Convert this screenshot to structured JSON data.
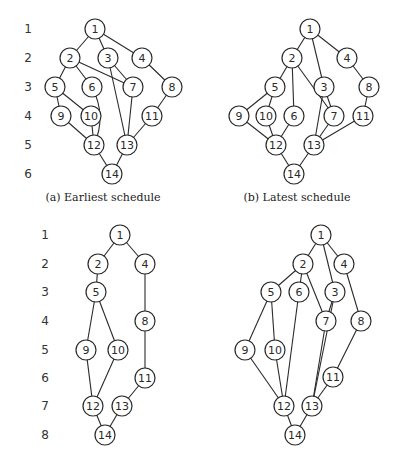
{
  "figure": {
    "node_radius": 10,
    "colors": {
      "stroke": "#2a2a2a",
      "fill": "#ffffff",
      "text": "#2a2a2a"
    }
  },
  "row_labels": [
    {
      "panel": "top",
      "x": 28,
      "rows": [
        {
          "label": "1",
          "y": 29
        },
        {
          "label": "2",
          "y": 58
        },
        {
          "label": "3",
          "y": 87
        },
        {
          "label": "4",
          "y": 116
        },
        {
          "label": "5",
          "y": 145
        },
        {
          "label": "6",
          "y": 174
        }
      ]
    },
    {
      "panel": "bottom",
      "x": 45,
      "rows": [
        {
          "label": "1",
          "y": 235
        },
        {
          "label": "2",
          "y": 264
        },
        {
          "label": "3",
          "y": 292
        },
        {
          "label": "4",
          "y": 321
        },
        {
          "label": "5",
          "y": 350
        },
        {
          "label": "6",
          "y": 378
        },
        {
          "label": "7",
          "y": 406
        },
        {
          "label": "8",
          "y": 435
        }
      ]
    }
  ],
  "graphs": [
    {
      "id": "a",
      "caption": "(a)  Earliest schedule",
      "caption_pos": [
        103,
        197
      ],
      "nodes": [
        {
          "id": "1",
          "x": 95,
          "y": 29
        },
        {
          "id": "2",
          "x": 70,
          "y": 58
        },
        {
          "id": "3",
          "x": 108,
          "y": 58
        },
        {
          "id": "4",
          "x": 142,
          "y": 58
        },
        {
          "id": "5",
          "x": 55,
          "y": 87
        },
        {
          "id": "6",
          "x": 92,
          "y": 87
        },
        {
          "id": "7",
          "x": 133,
          "y": 87
        },
        {
          "id": "8",
          "x": 172,
          "y": 87
        },
        {
          "id": "9",
          "x": 61,
          "y": 116
        },
        {
          "id": "10",
          "x": 91,
          "y": 116
        },
        {
          "id": "11",
          "x": 152,
          "y": 116
        },
        {
          "id": "12",
          "x": 94,
          "y": 145
        },
        {
          "id": "13",
          "x": 127,
          "y": 145
        },
        {
          "id": "14",
          "x": 112,
          "y": 174
        }
      ],
      "edges": [
        [
          "1",
          "2"
        ],
        [
          "1",
          "3"
        ],
        [
          "1",
          "4"
        ],
        [
          "2",
          "5"
        ],
        [
          "2",
          "6"
        ],
        [
          "2",
          "7"
        ],
        [
          "3",
          "7"
        ],
        [
          "3",
          "13"
        ],
        [
          "4",
          "8"
        ],
        [
          "5",
          "9"
        ],
        [
          "5",
          "10"
        ],
        [
          "6",
          "12",
          "curve"
        ],
        [
          "7",
          "13"
        ],
        [
          "8",
          "11"
        ],
        [
          "9",
          "12"
        ],
        [
          "10",
          "12"
        ],
        [
          "11",
          "13"
        ],
        [
          "12",
          "14"
        ],
        [
          "13",
          "14"
        ]
      ]
    },
    {
      "id": "b",
      "caption": "(b)  Latest schedule",
      "caption_pos": [
        297,
        197
      ],
      "nodes": [
        {
          "id": "1",
          "x": 310,
          "y": 29
        },
        {
          "id": "2",
          "x": 292,
          "y": 58
        },
        {
          "id": "4",
          "x": 347,
          "y": 58
        },
        {
          "id": "5",
          "x": 275,
          "y": 87
        },
        {
          "id": "3",
          "x": 324,
          "y": 87
        },
        {
          "id": "8",
          "x": 369,
          "y": 87
        },
        {
          "id": "9",
          "x": 239,
          "y": 116
        },
        {
          "id": "10",
          "x": 266,
          "y": 116
        },
        {
          "id": "6",
          "x": 294,
          "y": 116
        },
        {
          "id": "7",
          "x": 334,
          "y": 116
        },
        {
          "id": "11",
          "x": 363,
          "y": 116
        },
        {
          "id": "12",
          "x": 276,
          "y": 145
        },
        {
          "id": "13",
          "x": 314,
          "y": 145
        },
        {
          "id": "14",
          "x": 294,
          "y": 174
        }
      ],
      "edges": [
        [
          "1",
          "2"
        ],
        [
          "1",
          "3"
        ],
        [
          "1",
          "4"
        ],
        [
          "2",
          "5"
        ],
        [
          "2",
          "6"
        ],
        [
          "2",
          "7"
        ],
        [
          "3",
          "7"
        ],
        [
          "3",
          "13"
        ],
        [
          "4",
          "8"
        ],
        [
          "5",
          "9"
        ],
        [
          "5",
          "10"
        ],
        [
          "6",
          "12"
        ],
        [
          "7",
          "13"
        ],
        [
          "8",
          "11"
        ],
        [
          "9",
          "12"
        ],
        [
          "10",
          "12"
        ],
        [
          "11",
          "13"
        ],
        [
          "12",
          "14"
        ],
        [
          "13",
          "14"
        ]
      ]
    },
    {
      "id": "c",
      "caption": "",
      "caption_pos": null,
      "nodes": [
        {
          "id": "1",
          "x": 120,
          "y": 235
        },
        {
          "id": "2",
          "x": 98,
          "y": 264
        },
        {
          "id": "4",
          "x": 145,
          "y": 264
        },
        {
          "id": "5",
          "x": 96,
          "y": 292
        },
        {
          "id": "8",
          "x": 145,
          "y": 321
        },
        {
          "id": "9",
          "x": 86,
          "y": 350
        },
        {
          "id": "10",
          "x": 118,
          "y": 350
        },
        {
          "id": "11",
          "x": 145,
          "y": 378
        },
        {
          "id": "12",
          "x": 93,
          "y": 406
        },
        {
          "id": "13",
          "x": 122,
          "y": 406
        },
        {
          "id": "14",
          "x": 105,
          "y": 435
        }
      ],
      "edges": [
        [
          "1",
          "2"
        ],
        [
          "1",
          "4"
        ],
        [
          "2",
          "5"
        ],
        [
          "4",
          "8"
        ],
        [
          "5",
          "9"
        ],
        [
          "5",
          "10"
        ],
        [
          "8",
          "11"
        ],
        [
          "9",
          "12"
        ],
        [
          "10",
          "12"
        ],
        [
          "11",
          "13"
        ],
        [
          "12",
          "14"
        ],
        [
          "13",
          "14"
        ]
      ]
    },
    {
      "id": "d",
      "caption": "",
      "caption_pos": null,
      "nodes": [
        {
          "id": "1",
          "x": 321,
          "y": 235
        },
        {
          "id": "2",
          "x": 303,
          "y": 264
        },
        {
          "id": "4",
          "x": 344,
          "y": 264
        },
        {
          "id": "5",
          "x": 271,
          "y": 292
        },
        {
          "id": "6",
          "x": 299,
          "y": 292
        },
        {
          "id": "3",
          "x": 335,
          "y": 292
        },
        {
          "id": "7",
          "x": 326,
          "y": 321
        },
        {
          "id": "8",
          "x": 361,
          "y": 321
        },
        {
          "id": "9",
          "x": 245,
          "y": 350
        },
        {
          "id": "10",
          "x": 275,
          "y": 350
        },
        {
          "id": "11",
          "x": 333,
          "y": 377
        },
        {
          "id": "12",
          "x": 284,
          "y": 406
        },
        {
          "id": "13",
          "x": 312,
          "y": 406
        },
        {
          "id": "14",
          "x": 295,
          "y": 435
        }
      ],
      "edges": [
        [
          "1",
          "2"
        ],
        [
          "1",
          "3"
        ],
        [
          "1",
          "4"
        ],
        [
          "2",
          "5"
        ],
        [
          "2",
          "6"
        ],
        [
          "2",
          "7"
        ],
        [
          "3",
          "7"
        ],
        [
          "3",
          "13"
        ],
        [
          "4",
          "8"
        ],
        [
          "5",
          "9"
        ],
        [
          "5",
          "10"
        ],
        [
          "6",
          "12"
        ],
        [
          "7",
          "13"
        ],
        [
          "8",
          "11"
        ],
        [
          "9",
          "12"
        ],
        [
          "10",
          "12"
        ],
        [
          "11",
          "13"
        ],
        [
          "12",
          "14"
        ],
        [
          "13",
          "14"
        ]
      ]
    }
  ]
}
